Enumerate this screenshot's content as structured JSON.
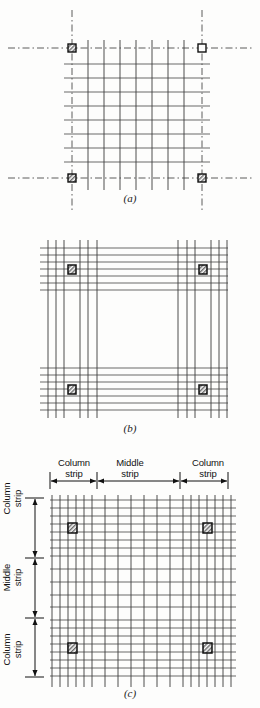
{
  "figure": {
    "type": "engineering-diagram",
    "background_color": "#fdfdfc",
    "line_color": "#3c3c3c",
    "heavy_line_color": "#1e1e1e",
    "column_fill": "#8c8c8c",
    "column_border": "#111111"
  },
  "panels": [
    {
      "id": "a",
      "caption": "(a)",
      "description": "Uniform square grid of bars with dash-dot column centerlines",
      "grid": {
        "columns": 8,
        "rows": 8,
        "uniform": true
      },
      "centerlines": {
        "style": "dash-dot",
        "count_h": 2,
        "count_v": 2
      },
      "columns": [
        {
          "position": "top-left",
          "fill": "hatched"
        },
        {
          "position": "top-right",
          "fill": "hollow"
        },
        {
          "position": "bottom-left",
          "fill": "hatched"
        },
        {
          "position": "bottom-right",
          "fill": "hatched"
        }
      ]
    },
    {
      "id": "b",
      "caption": "(b)",
      "description": "Bars concentrated in bands over the column lines, middle region empty",
      "bands": {
        "vertical_bands": 2,
        "horizontal_bands": 2,
        "bars_per_band": 7
      },
      "columns": [
        {
          "position": "top-left",
          "fill": "hatched"
        },
        {
          "position": "top-right",
          "fill": "hatched"
        },
        {
          "position": "bottom-left",
          "fill": "hatched"
        },
        {
          "position": "bottom-right",
          "fill": "hatched"
        }
      ]
    },
    {
      "id": "c",
      "caption": "(c)",
      "description": "Combined layout: closely spaced bars in column strips, wider spacing in middle strip",
      "columns": [
        {
          "position": "top-left",
          "fill": "hatched"
        },
        {
          "position": "top-right",
          "fill": "hatched"
        },
        {
          "position": "bottom-left",
          "fill": "hatched"
        },
        {
          "position": "bottom-right",
          "fill": "hatched"
        }
      ],
      "strip_labels_top": [
        {
          "text": "Column\nstrip"
        },
        {
          "text": "Middle\nstrip"
        },
        {
          "text": "Column\nstrip"
        }
      ],
      "strip_labels_left": [
        {
          "text": "Column\nstrip"
        },
        {
          "text": "Middle\nstrip"
        },
        {
          "text": "Column\nstrip"
        }
      ],
      "dimension_lines": {
        "orientation": [
          "horizontal",
          "vertical"
        ],
        "arrowheads": "double"
      }
    }
  ]
}
